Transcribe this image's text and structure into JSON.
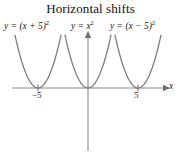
{
  "figure": {
    "title": "Horizontal shifts",
    "width": 181,
    "height": 168,
    "background": "#ffffff"
  },
  "labels": {
    "left_equation": {
      "lhs": "y = (x + 5)",
      "exponent": "2",
      "full": "y = (x + 5)²"
    },
    "middle_equation": {
      "lhs": "y = x",
      "exponent": "2",
      "full": "y = x²"
    },
    "right_equation": {
      "lhs": "y = (x − 5)",
      "exponent": "2",
      "full": "y = (x − 5)²"
    }
  },
  "axes": {
    "x_axis_label": "x",
    "tick_labels": [
      "−5",
      "5"
    ],
    "tick_values": [
      -5,
      5
    ],
    "axis_color": "#8a8a8a",
    "origin_px": {
      "x": 88,
      "y": 88
    },
    "units_per_px": 0.1
  },
  "chart_data": {
    "type": "line",
    "title": "Horizontal shifts",
    "xlabel": "x",
    "ylabel": "",
    "grid": false,
    "legend": "inline-curve-labels",
    "xlim": [
      -9.3,
      9.3
    ],
    "ylim": [
      -8.0,
      5.6
    ],
    "xticks": [
      -5,
      5
    ],
    "xticklabels": [
      "−5",
      "5"
    ],
    "yticks": [],
    "curve_color": "#7a7a7a",
    "series": [
      {
        "name": "y = (x + 5)²",
        "equation": "y = (x + 5)^2",
        "vertex": [
          -5,
          0
        ],
        "shift": "left 5 units",
        "x": [
          -7.3,
          -7.0,
          -6.5,
          -6.0,
          -5.5,
          -5.0,
          -4.5,
          -4.0,
          -3.5,
          -3.0,
          -2.7
        ],
        "y": [
          5.29,
          4.0,
          2.25,
          1.0,
          0.25,
          0.0,
          0.25,
          1.0,
          2.25,
          4.0,
          5.29
        ]
      },
      {
        "name": "y = x²",
        "equation": "y = x^2",
        "vertex": [
          0,
          0
        ],
        "shift": "none",
        "x": [
          -2.3,
          -2.0,
          -1.5,
          -1.0,
          -0.5,
          0.0,
          0.5,
          1.0,
          1.5,
          2.0,
          2.3
        ],
        "y": [
          5.29,
          4.0,
          2.25,
          1.0,
          0.25,
          0.0,
          0.25,
          1.0,
          2.25,
          4.0,
          5.29
        ]
      },
      {
        "name": "y = (x − 5)²",
        "equation": "y = (x - 5)^2",
        "vertex": [
          5,
          0
        ],
        "shift": "right 5 units",
        "x": [
          2.7,
          3.0,
          3.5,
          4.0,
          4.5,
          5.0,
          5.5,
          6.0,
          6.5,
          7.0,
          7.3
        ],
        "y": [
          5.29,
          4.0,
          2.25,
          1.0,
          0.25,
          0.0,
          0.25,
          1.0,
          2.25,
          4.0,
          5.29
        ]
      }
    ]
  }
}
